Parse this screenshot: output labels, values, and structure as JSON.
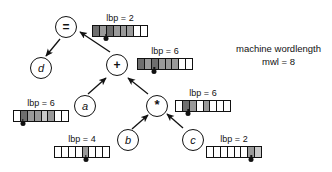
{
  "figure": {
    "machine_note_line1": "machine wordlength",
    "machine_note_line2": "mwl = 8",
    "mwl": 8
  },
  "nodes": [
    {
      "id": "eq",
      "label": "=",
      "kind": "operator",
      "x": 55,
      "y": 16
    },
    {
      "id": "d",
      "label": "d",
      "kind": "variable",
      "x": 30,
      "y": 57
    },
    {
      "id": "plus",
      "label": "+",
      "kind": "operator",
      "x": 106,
      "y": 54
    },
    {
      "id": "a",
      "label": "a",
      "kind": "variable",
      "x": 74,
      "y": 95
    },
    {
      "id": "star",
      "label": "*",
      "kind": "operator",
      "x": 146,
      "y": 95
    },
    {
      "id": "b",
      "label": "b",
      "kind": "variable",
      "x": 117,
      "y": 129
    },
    {
      "id": "c",
      "label": "c",
      "kind": "variable",
      "x": 182,
      "y": 129
    }
  ],
  "edges": [
    {
      "from": "eq",
      "to": "d",
      "direction": "down-left"
    },
    {
      "from": "plus",
      "to": "eq",
      "direction": "up-left"
    },
    {
      "from": "a",
      "to": "plus",
      "direction": "up-right"
    },
    {
      "from": "star",
      "to": "plus",
      "direction": "up-left"
    },
    {
      "from": "b",
      "to": "star",
      "direction": "up-right"
    },
    {
      "from": "c",
      "to": "star",
      "direction": "up-left"
    }
  ],
  "words": [
    {
      "id": "word-eq",
      "owner": "eq",
      "label": "lbp = 2",
      "lbp": 2,
      "x": 92,
      "y": 13,
      "label_x_offset": 22,
      "marker_pos_pct": 25,
      "cells": [
        "f-dark",
        "f-gray",
        "f-dark",
        "f-gray",
        "f-gray",
        "f-gray",
        "f-white",
        "f-white"
      ]
    },
    {
      "id": "word-plus",
      "owner": "plus",
      "label": "lbp = 6",
      "lbp": 6,
      "x": 137,
      "y": 46,
      "label_x_offset": 28,
      "marker_pos_pct": 31,
      "cells": [
        "f-dark",
        "f-gray",
        "f-dark",
        "f-gray",
        "f-gray",
        "f-gray",
        "f-white",
        "f-white"
      ]
    },
    {
      "id": "word-star",
      "owner": "star",
      "label": "lbp = 6",
      "lbp": 6,
      "x": 175,
      "y": 88,
      "label_x_offset": 28,
      "marker_pos_pct": 24,
      "cells": [
        "f-white",
        "f-dark",
        "f-gray",
        "f-white",
        "f-gray",
        "f-white",
        "f-white",
        "f-white"
      ]
    },
    {
      "id": "word-a",
      "owner": "a",
      "label": "lbp = 6",
      "lbp": 6,
      "x": 13,
      "y": 98,
      "label_x_offset": 28,
      "marker_pos_pct": 17,
      "cells": [
        "f-white",
        "f-dark",
        "f-gray",
        "f-gray",
        "f-light",
        "f-gray",
        "f-white",
        "f-white"
      ]
    },
    {
      "id": "word-b",
      "owner": "b",
      "label": "lbp = 4",
      "lbp": 4,
      "x": 54,
      "y": 134,
      "label_x_offset": 28,
      "marker_pos_pct": 57,
      "cells": [
        "f-white",
        "f-white",
        "f-white",
        "f-white",
        "f-gray",
        "f-white",
        "f-white",
        "f-white"
      ]
    },
    {
      "id": "word-c",
      "owner": "c",
      "label": "lbp = 2",
      "lbp": 2,
      "x": 206,
      "y": 134,
      "label_x_offset": 28,
      "marker_pos_pct": 81,
      "cells": [
        "f-white",
        "f-white",
        "f-white",
        "f-white",
        "f-white",
        "f-white",
        "f-gray",
        "f-light"
      ]
    }
  ],
  "note": {
    "x": 236,
    "y": 42
  }
}
